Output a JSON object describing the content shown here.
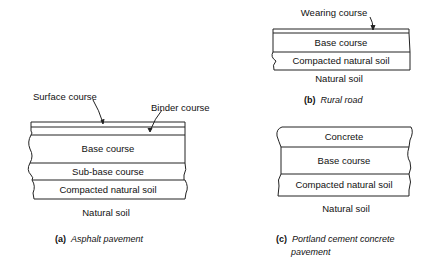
{
  "diagram_a": {
    "labels": {
      "surface_course": "Surface course",
      "binder_course": "Binder course",
      "base_course": "Base course",
      "sub_base_course": "Sub-base course",
      "compacted_natural_soil": "Compacted natural soil",
      "natural_soil": "Natural soil"
    },
    "caption_letter": "(a)",
    "caption_text": "Asphalt pavement"
  },
  "diagram_b": {
    "labels": {
      "wearing_course": "Wearing course",
      "base_course": "Base course",
      "compacted_natural_soil": "Compacted natural soil",
      "natural_soil": "Natural soil"
    },
    "caption_letter": "(b)",
    "caption_text": "Rural road"
  },
  "diagram_c": {
    "labels": {
      "concrete": "Concrete",
      "base_course": "Base course",
      "compacted_natural_soil": "Compacted natural soil",
      "natural_soil": "Natural soil"
    },
    "caption_letter": "(c)",
    "caption_text_line1": "Portland cement concrete",
    "caption_text_line2": "pavement"
  }
}
